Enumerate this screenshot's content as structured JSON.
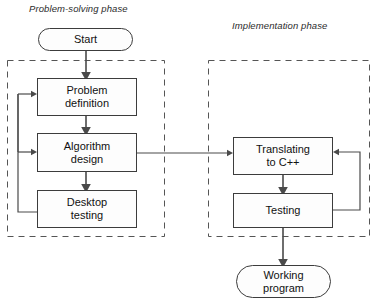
{
  "diagram": {
    "phases": [
      {
        "id": "problem-solving",
        "label": "Problem-solving phase"
      },
      {
        "id": "implementation",
        "label": "Implementation phase"
      }
    ],
    "nodes": [
      {
        "id": "start",
        "label": "Start",
        "shape": "terminator",
        "phase": "none"
      },
      {
        "id": "problem-def",
        "label": "Problem\ndefinition",
        "line1": "Problem",
        "line2": "definition",
        "shape": "process",
        "phase": "problem-solving"
      },
      {
        "id": "algorithm",
        "label": "Algorithm\ndesign",
        "line1": "Algorithm",
        "line2": "design",
        "shape": "process",
        "phase": "problem-solving"
      },
      {
        "id": "desktop-test",
        "label": "Desktop\ntesting",
        "line1": "Desktop",
        "line2": "testing",
        "shape": "process",
        "phase": "problem-solving"
      },
      {
        "id": "translating",
        "label": "Translating\nto C++",
        "line1": "Translating",
        "line2": "to C++",
        "shape": "process",
        "phase": "implementation"
      },
      {
        "id": "testing",
        "label": "Testing",
        "line1": "Testing",
        "line2": "",
        "shape": "process",
        "phase": "implementation"
      },
      {
        "id": "working",
        "label": "Working\nprogram",
        "line1": "Working",
        "line2": "program",
        "shape": "terminator",
        "phase": "none"
      }
    ],
    "edges": [
      {
        "from": "start",
        "to": "problem-def",
        "kind": "straight-down",
        "arrow": true
      },
      {
        "from": "problem-def",
        "to": "algorithm",
        "kind": "straight-down",
        "arrow": true
      },
      {
        "from": "algorithm",
        "to": "desktop-test",
        "kind": "straight-down",
        "arrow": true
      },
      {
        "from": "desktop-test",
        "to": "problem-def",
        "kind": "feedback-left",
        "arrow": true
      },
      {
        "from": "desktop-test",
        "to": "algorithm",
        "kind": "feedback-left",
        "arrow": true
      },
      {
        "from": "algorithm",
        "to": "translating",
        "kind": "cross-phase",
        "arrow": true
      },
      {
        "from": "translating",
        "to": "testing",
        "kind": "straight-down",
        "arrow": true
      },
      {
        "from": "testing",
        "to": "translating",
        "kind": "feedback-right",
        "arrow": true
      },
      {
        "from": "testing",
        "to": "working",
        "kind": "straight-down",
        "arrow": true
      }
    ],
    "colors": {
      "stroke": "#3c3c3c",
      "connector": "#4a4a4a",
      "dashed_boundary": "#555555",
      "node_fill": "#fdfdfd",
      "text": "#111111",
      "background": "#ffffff"
    }
  }
}
